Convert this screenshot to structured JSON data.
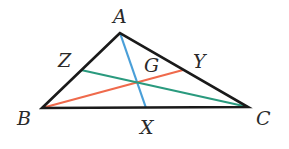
{
  "diagram": {
    "type": "triangle-medians",
    "vertices": {
      "A": {
        "label": "A",
        "x": 120,
        "y": 33
      },
      "B": {
        "label": "B",
        "x": 42,
        "y": 108
      },
      "C": {
        "label": "C",
        "x": 248,
        "y": 107
      }
    },
    "midpoints": {
      "X": {
        "label": "X",
        "on": "BC",
        "x": 146,
        "y": 108
      },
      "Y": {
        "label": "Y",
        "on": "AC",
        "x": 183,
        "y": 70
      },
      "Z": {
        "label": "Z",
        "on": "AB",
        "x": 81,
        "y": 70
      }
    },
    "centroid": {
      "label": "G",
      "x": 141,
      "y": 82
    },
    "medians": [
      {
        "from": "A",
        "to": "X",
        "color": "#4a9fd8"
      },
      {
        "from": "B",
        "to": "Y",
        "color": "#ef6a4c"
      },
      {
        "from": "C",
        "to": "Z",
        "color": "#2a9a7e"
      }
    ],
    "labels": {
      "A": "A",
      "B": "B",
      "C": "C",
      "X": "X",
      "Y": "Y",
      "Z": "Z",
      "G": "G"
    },
    "colors": {
      "triangle": "#1a1a1a",
      "median_AX": "#4a9fd8",
      "median_BY": "#ef6a4c",
      "median_CZ": "#2a9a7e"
    }
  }
}
